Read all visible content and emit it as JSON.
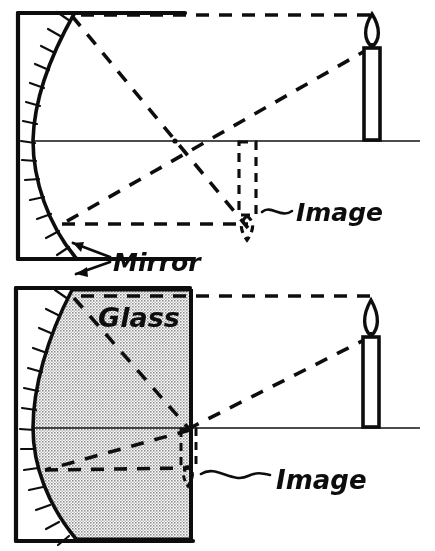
{
  "figure": {
    "background_color": "#ffffff",
    "ink_color": "#111111",
    "glass_fill_color": "#d0d0d0",
    "width": 435,
    "height": 551
  },
  "panels": [
    {
      "id": "top-panel",
      "name": "mirror-in-air",
      "medium_label": "",
      "mirror_label": "Mirror",
      "image_label": "Image",
      "object": {
        "name": "candle",
        "upright": true,
        "x": 372,
        "base_y": 140,
        "top_y": 48,
        "flame_tip_y": 14
      },
      "image": {
        "name": "image-candle",
        "inverted": true,
        "dashed": true,
        "x": 247,
        "base_y": 141,
        "bottom_y": 228
      },
      "optical_axis_y": 141,
      "focal_point_x": 175,
      "mirror_vertex_x": 33,
      "rays": [
        {
          "name": "parallel-ray-in",
          "from": [
            372,
            48
          ],
          "to": [
            72,
            14
          ]
        },
        {
          "name": "reflected-ray-through-focus",
          "from": [
            72,
            14
          ],
          "to": [
            248,
            228
          ]
        },
        {
          "name": "ray-through-center",
          "from": [
            372,
            48
          ],
          "to": [
            62,
            224
          ]
        },
        {
          "name": "reflected-ray-parallel-out",
          "from": [
            62,
            224
          ],
          "to": [
            248,
            224
          ]
        }
      ]
    },
    {
      "id": "bottom-panel",
      "name": "mirror-in-glass",
      "medium_label": "Glass",
      "mirror_label": "",
      "image_label": "Image",
      "object": {
        "name": "candle",
        "upright": true,
        "x": 371,
        "base_y": 427,
        "top_y": 337,
        "flame_tip_y": 300
      },
      "image": {
        "name": "image-candle",
        "inverted": true,
        "dashed": true,
        "x": 188,
        "base_y": 428,
        "bottom_y": 484
      },
      "optical_axis_y": 428,
      "mirror_vertex_x": 33,
      "glass_block": {
        "left": 55,
        "right": 193,
        "top": 288,
        "bottom": 540
      },
      "rays": [
        {
          "name": "parallel-ray-in",
          "from": [
            371,
            337
          ],
          "to": [
            72,
            297
          ]
        },
        {
          "name": "refracted-converging-ray",
          "from": [
            72,
            297
          ],
          "to": [
            190,
            430
          ]
        },
        {
          "name": "ray-through-center",
          "from": [
            371,
            337
          ],
          "to": [
            45,
            470
          ]
        },
        {
          "name": "reflected-ray-out",
          "from": [
            45,
            470
          ],
          "to": [
            190,
            468
          ]
        }
      ]
    }
  ],
  "annotations": [
    {
      "id": "mirror-callout",
      "text": "Mirror",
      "x": 113,
      "y": 270,
      "pointer": "double-arrow-to-mirror"
    },
    {
      "id": "glass-callout",
      "text": "Glass",
      "x": 98,
      "y": 325,
      "pointer": "none"
    },
    {
      "id": "image-callout-top",
      "text": "Image",
      "x": 293,
      "y": 215,
      "pointer": "wavy-leader"
    },
    {
      "id": "image-callout-bottom",
      "text": "Image",
      "x": 275,
      "y": 482,
      "pointer": "wavy-leader"
    }
  ],
  "legend": {
    "solid_line_meaning": "optical axis / physical object outlines",
    "dashed_line_meaning": "light rays and virtual image outline",
    "hatched_line_meaning": "back (silvered) side of mirror",
    "stipple_fill_meaning": "glass medium"
  }
}
